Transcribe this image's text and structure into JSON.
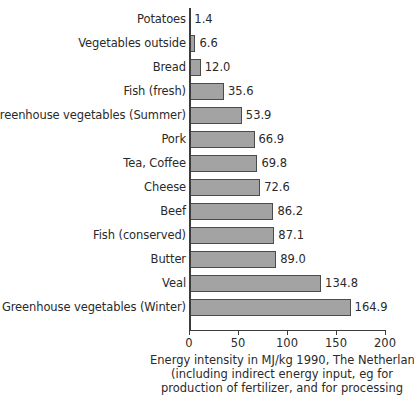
{
  "chart_data": {
    "type": "bar",
    "orientation": "horizontal",
    "title": "",
    "xlabel": "Energy intensity in MJ/kg 1990, The Netherlands",
    "ylabel": "",
    "xlim": [
      0,
      200
    ],
    "xticks": [
      0,
      50,
      100,
      150,
      200
    ],
    "grid": false,
    "legend": false,
    "bar_color": "#a3a3a3",
    "bar_border_color": "#4a4a4a",
    "categories": [
      "Potatoes",
      "Vegetables outside",
      "Bread",
      "Fish (fresh)",
      "Greenhouse vegetables (Summer)",
      "Pork",
      "Tea, Coffee",
      "Cheese",
      "Beef",
      "Fish (conserved)",
      "Butter",
      "Veal",
      "Greenhouse vegetables (Winter)"
    ],
    "values": [
      1.4,
      6.6,
      12.0,
      35.6,
      53.9,
      66.9,
      69.8,
      72.6,
      86.2,
      87.1,
      89.0,
      134.8,
      164.9
    ],
    "value_labels": [
      "1.4",
      "6.6",
      "12.0",
      "35.6",
      "53.9",
      "66.9",
      "69.8",
      "72.6",
      "86.2",
      "87.1",
      "89.0",
      "134.8",
      "164.9"
    ],
    "tick_labels": [
      "0",
      "50",
      "100",
      "150",
      "200"
    ]
  },
  "caption": {
    "line1": "Energy intensity in MJ/kg 1990, The Netherlands",
    "line2": "(including indirect energy input, eg for",
    "line3": "production of fertilizer, and for processing"
  }
}
